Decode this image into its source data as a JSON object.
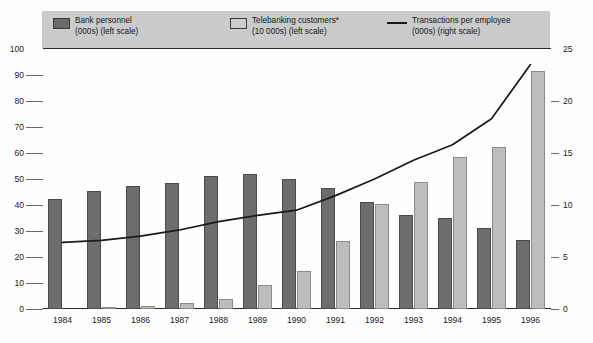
{
  "legend": {
    "entries": [
      {
        "marker": "dark-swatch",
        "line1": "Bank personnel",
        "line2": "(000s) (left scale)"
      },
      {
        "marker": "light-swatch",
        "line1": "Telebanking customers*",
        "line2": "(10 000s) (left scale)"
      },
      {
        "marker": "line-swatch",
        "line1": "Transactions per employee",
        "line2": "(000s) (right scale)"
      }
    ],
    "background_color": "#c9cbcc"
  },
  "colors": {
    "bank_personnel": "#6d6d6d",
    "telebanking": "#bcbdbe",
    "transactions_line": "#1a1a1a",
    "axis": "#2a2a2a",
    "background": "#fefefe"
  },
  "axes": {
    "left_ticks": [
      "100",
      "90",
      "80",
      "70",
      "60",
      "50",
      "40",
      "30",
      "20",
      "10",
      "0"
    ],
    "right_ticks": [
      "25",
      "20",
      "15",
      "10",
      "5",
      "0"
    ],
    "left_min": 0,
    "left_max": 100,
    "right_min": 0,
    "right_max": 25
  },
  "chart_data": {
    "type": "bar",
    "title": "",
    "subtitle": "",
    "xlabel": "",
    "ylabel": "",
    "y2label": "",
    "grid": false,
    "legend_position": "top",
    "categories": [
      "1984",
      "1985",
      "1986",
      "1987",
      "1988",
      "1989",
      "1990",
      "1991",
      "1992",
      "1993",
      "1994",
      "1995",
      "1996"
    ],
    "ylim": [
      0,
      100
    ],
    "y2lim": [
      0,
      25
    ],
    "series": [
      {
        "name": "Bank personnel",
        "type": "bar",
        "axis": "left",
        "unit": "(000s)",
        "color": "#6d6d6d",
        "values": [
          42.5,
          45.5,
          47.5,
          48.5,
          51.0,
          52.0,
          50.0,
          46.5,
          41.0,
          36.0,
          35.0,
          31.0,
          26.5
        ]
      },
      {
        "name": "Telebanking customers*",
        "type": "bar",
        "axis": "left",
        "unit": "(10 000s)",
        "color": "#bcbdbe",
        "values": [
          0.0,
          0.7,
          1.0,
          2.2,
          4.0,
          9.3,
          14.5,
          26.0,
          40.5,
          48.8,
          58.5,
          62.5,
          91.5
        ]
      },
      {
        "name": "Transactions per employee",
        "type": "line",
        "axis": "right",
        "unit": "(000s)",
        "color": "#1a1a1a",
        "values": [
          6.4,
          6.6,
          7.0,
          7.6,
          8.4,
          9.0,
          9.5,
          10.9,
          12.5,
          14.3,
          15.8,
          18.3,
          23.5
        ]
      }
    ]
  }
}
